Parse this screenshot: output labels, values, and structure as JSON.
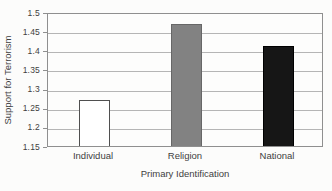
{
  "chart_data": {
    "type": "bar",
    "title": "",
    "categories": [
      "Individual",
      "Religion",
      "National"
    ],
    "values": [
      1.27,
      1.47,
      1.41
    ],
    "xlabel": "Primary Identification",
    "ylabel": "Support for Terrorism",
    "ylim": [
      1.15,
      1.5
    ],
    "yticks": [
      1.15,
      1.2,
      1.25,
      1.3,
      1.35,
      1.4,
      1.45,
      1.5
    ],
    "ytick_labels": [
      "1.15",
      "1.2",
      "1.25",
      "1.3",
      "1.35",
      "1.4",
      "1.45",
      "1.5"
    ],
    "grid": "horizontal gridlines at each y tick",
    "legend": "none",
    "bar_colors": [
      "#ffffff",
      "#828282",
      "#161616"
    ],
    "bar_border_colors": [
      "#4f4f4f",
      "#676767",
      "#000000"
    ]
  },
  "styles": {
    "background": "#fcfcfb",
    "plot_background": "#fdfdfc",
    "plot_border_color": "#8f8f8f",
    "grid_color": "#b5b5b5",
    "text_color": "#3e3e3e"
  }
}
